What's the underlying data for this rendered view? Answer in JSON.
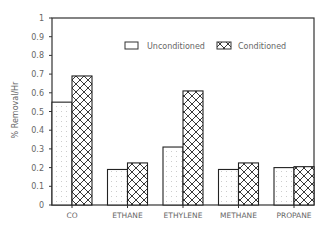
{
  "chart_data": {
    "type": "bar",
    "title": "",
    "xlabel": "",
    "ylabel": "% Removal/Hr",
    "ylim": [
      0,
      1
    ],
    "yticks": [
      0,
      0.1,
      0.2,
      0.3,
      0.4,
      0.5,
      0.6,
      0.7,
      0.8,
      0.9,
      1
    ],
    "ytick_labels": [
      "0",
      "0.1",
      "0.2",
      "0.3",
      "0.4",
      "0.5",
      "0.6",
      "0.7",
      "0.8",
      "0.9",
      "1"
    ],
    "grid": false,
    "legend_position": "upper right",
    "categories": [
      "CO",
      "ETHANE",
      "ETHYLENE",
      "METHANE",
      "PROPANE"
    ],
    "series": [
      {
        "name": "Unconditioned",
        "pattern": "dots",
        "values": [
          0.55,
          0.19,
          0.31,
          0.19,
          0.2
        ]
      },
      {
        "name": "Conditioned",
        "pattern": "crosshatch",
        "values": [
          0.69,
          0.225,
          0.61,
          0.225,
          0.205
        ]
      }
    ]
  },
  "legend": {
    "unconditioned_label": "Unconditioned",
    "conditioned_label": "Conditioned"
  },
  "axis": {
    "ylabel": "% Removal/Hr"
  }
}
